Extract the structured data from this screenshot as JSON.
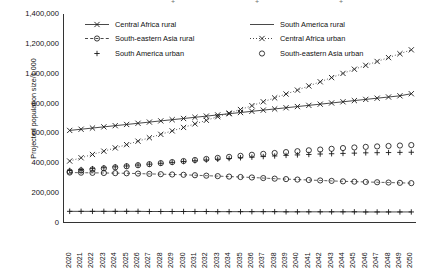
{
  "axes": {
    "ylabel": "Projected population size/1,000",
    "yticks": [
      "0",
      "200,000",
      "400,000",
      "600,000",
      "800,000",
      "1,000,000",
      "1,200,000",
      "1,400,000"
    ],
    "ytick_values": [
      0,
      200000,
      400000,
      600000,
      800000,
      1000000,
      1200000,
      1400000
    ],
    "xticks": [
      "2020",
      "2021",
      "2022",
      "2023",
      "2024",
      "2025",
      "2026",
      "2027",
      "2028",
      "2029",
      "2030",
      "2031",
      "2032",
      "2033",
      "2034",
      "2035",
      "2036",
      "2037",
      "2038",
      "2039",
      "2040",
      "2041",
      "2042",
      "2043",
      "2044",
      "2045",
      "2046",
      "2047",
      "2048",
      "2049",
      "2050"
    ]
  },
  "legend": {
    "position": "top-inside",
    "items": [
      {
        "label": "Central Africa rural",
        "marker": "x",
        "line": "solid",
        "key": "central-africa-rural"
      },
      {
        "label": "South America rural",
        "marker": "none",
        "line": "solid",
        "key": "south-america-rural"
      },
      {
        "label": "South-eastern Asia rural",
        "marker": "circle",
        "line": "dashed",
        "key": "south-eastern-asia-rural"
      },
      {
        "label": "Central Africa urban",
        "marker": "x",
        "line": "dotted",
        "key": "central-africa-urban"
      },
      {
        "label": "South America urban",
        "marker": "plus",
        "line": "none",
        "key": "south-america-urban"
      },
      {
        "label": "South-eastern Asia urban",
        "marker": "circle",
        "line": "none",
        "key": "south-eastern-asia-urban"
      }
    ]
  },
  "chart_data": {
    "type": "line",
    "title": "",
    "xlabel": "",
    "ylabel": "Projected population size/1,000",
    "ylim": [
      0,
      1400000
    ],
    "ytick_step": 200000,
    "grid": false,
    "legend_position": "top-inside",
    "x": [
      2020,
      2021,
      2022,
      2023,
      2024,
      2025,
      2026,
      2027,
      2028,
      2029,
      2030,
      2031,
      2032,
      2033,
      2034,
      2035,
      2036,
      2037,
      2038,
      2039,
      2040,
      2041,
      2042,
      2043,
      2044,
      2045,
      2046,
      2047,
      2048,
      2049,
      2050
    ],
    "series": [
      {
        "name": "Central Africa rural",
        "marker": "x",
        "line": "solid",
        "values": [
          620000,
          628000,
          636000,
          644000,
          652000,
          660000,
          668000,
          676000,
          684000,
          692000,
          700000,
          708000,
          716000,
          724000,
          732000,
          740000,
          748000,
          756000,
          764000,
          772000,
          780000,
          788000,
          796000,
          804000,
          812000,
          820000,
          828000,
          836000,
          844000,
          852000,
          866000
        ]
      },
      {
        "name": "Central Africa urban",
        "marker": "x",
        "line": "dotted",
        "values": [
          415000,
          437000,
          459000,
          481000,
          503000,
          525000,
          548000,
          571000,
          594000,
          617000,
          640000,
          664000,
          688000,
          712000,
          736000,
          760000,
          786000,
          812000,
          838000,
          864000,
          890000,
          918000,
          946000,
          974000,
          1002000,
          1030000,
          1056000,
          1082000,
          1108000,
          1134000,
          1160000
        ]
      },
      {
        "name": "South-eastern Asia urban",
        "marker": "circle",
        "line": "none",
        "values": [
          345000,
          352000,
          359000,
          366000,
          373000,
          380000,
          387000,
          394000,
          401000,
          408000,
          415000,
          422000,
          429000,
          436000,
          443000,
          450000,
          457000,
          463000,
          469000,
          475000,
          481000,
          487000,
          492000,
          497000,
          502000,
          506000,
          510000,
          513000,
          516000,
          519000,
          522000
        ]
      },
      {
        "name": "South America urban",
        "marker": "plus",
        "line": "none",
        "values": [
          352000,
          358000,
          364000,
          370000,
          376000,
          382000,
          388000,
          394000,
          400000,
          406000,
          412000,
          417000,
          422000,
          427000,
          432000,
          437000,
          441000,
          445000,
          449000,
          453000,
          456000,
          459000,
          462000,
          464000,
          466000,
          468000,
          470000,
          471000,
          472000,
          473000,
          474000
        ]
      },
      {
        "name": "South-eastern Asia rural",
        "marker": "circle",
        "line": "dashed",
        "values": [
          338000,
          337000,
          336000,
          335000,
          334000,
          333000,
          331000,
          329000,
          327000,
          325000,
          323000,
          320000,
          317000,
          314000,
          311000,
          308000,
          305000,
          301000,
          297000,
          294000,
          291000,
          288000,
          285000,
          282000,
          279000,
          277000,
          275000,
          273000,
          271000,
          269000,
          267000
        ]
      },
      {
        "name": "South America rural",
        "marker": "plus",
        "line": "solid",
        "values": [
          78000,
          78000,
          78000,
          78000,
          78000,
          78000,
          78000,
          77000,
          77000,
          77000,
          77000,
          77000,
          77000,
          76000,
          76000,
          76000,
          76000,
          76000,
          76000,
          75000,
          75000,
          75000,
          75000,
          75000,
          75000,
          75000,
          74000,
          74000,
          74000,
          74000,
          74000
        ]
      }
    ]
  },
  "style": {
    "ink": "#1a1a1a",
    "axis": "#333333",
    "background": "#ffffff"
  }
}
